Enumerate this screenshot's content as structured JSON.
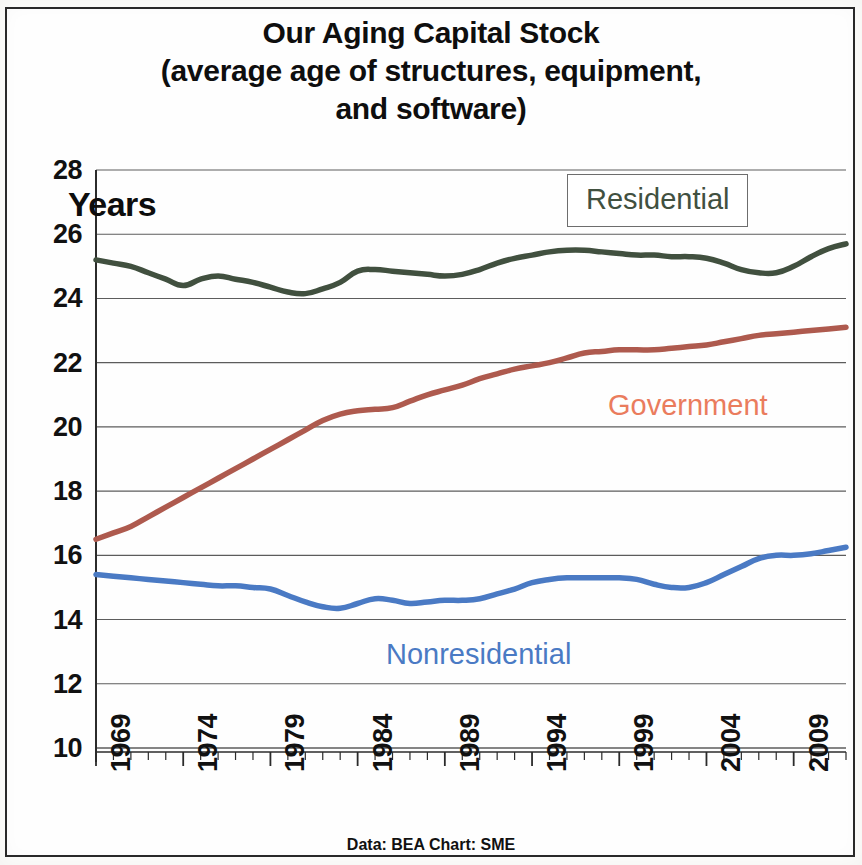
{
  "title": {
    "line1": "Our Aging Capital Stock",
    "line2": "(average age of structures, equipment,",
    "line3": "and software)"
  },
  "axis": {
    "y_label": "Years",
    "y_ticks": [
      "28",
      "26",
      "24",
      "22",
      "20",
      "18",
      "16",
      "14",
      "12",
      "10"
    ],
    "x_ticks": [
      "1969",
      "1974",
      "1979",
      "1984",
      "1989",
      "1994",
      "1999",
      "2004",
      "2009"
    ]
  },
  "labels": {
    "residential": "Residential",
    "government": "Government",
    "nonresidential": "Nonresidential"
  },
  "caption": "Data: BEA  Chart: SME",
  "colors": {
    "residential": "#41503f",
    "government": "#ae5a4e",
    "government_label": "#ea7c5d",
    "nonresidential": "#4a7ac4",
    "grid": "#5c5c5c",
    "axis": "#2b2b2b",
    "text": "#111111"
  },
  "chart_data": {
    "type": "line",
    "title": "Our Aging Capital Stock (average age of structures, equipment, and software)",
    "xlabel": "",
    "ylabel": "Years",
    "xlim": [
      1969,
      2012
    ],
    "ylim": [
      10,
      28
    ],
    "yticks": [
      10,
      12,
      14,
      16,
      18,
      20,
      22,
      24,
      26,
      28
    ],
    "xticks": [
      1969,
      1974,
      1979,
      1984,
      1989,
      1994,
      1999,
      2004,
      2009
    ],
    "grid": true,
    "legend_position": "inline-annotations",
    "annotations": [
      "Residential",
      "Government",
      "Nonresidential",
      "Data: BEA  Chart: SME"
    ],
    "x": [
      1969,
      1970,
      1971,
      1972,
      1973,
      1974,
      1975,
      1976,
      1977,
      1978,
      1979,
      1980,
      1981,
      1982,
      1983,
      1984,
      1985,
      1986,
      1987,
      1988,
      1989,
      1990,
      1991,
      1992,
      1993,
      1994,
      1995,
      1996,
      1997,
      1998,
      1999,
      2000,
      2001,
      2002,
      2003,
      2004,
      2005,
      2006,
      2007,
      2008,
      2009,
      2010,
      2011,
      2012
    ],
    "series": [
      {
        "name": "Residential",
        "color": "#41503f",
        "values": [
          25.2,
          25.1,
          25.0,
          24.8,
          24.6,
          24.4,
          24.6,
          24.7,
          24.6,
          24.5,
          24.35,
          24.2,
          24.15,
          24.3,
          24.5,
          24.85,
          24.9,
          24.85,
          24.8,
          24.75,
          24.7,
          24.75,
          24.9,
          25.1,
          25.25,
          25.35,
          25.45,
          25.5,
          25.5,
          25.45,
          25.4,
          25.35,
          25.35,
          25.3,
          25.3,
          25.25,
          25.1,
          24.9,
          24.8,
          24.8,
          25.0,
          25.3,
          25.55,
          25.7
        ]
      },
      {
        "name": "Government",
        "color": "#ae5a4e",
        "values": [
          16.5,
          16.7,
          16.9,
          17.2,
          17.5,
          17.8,
          18.1,
          18.4,
          18.7,
          19.0,
          19.3,
          19.6,
          19.9,
          20.2,
          20.4,
          20.5,
          20.55,
          20.6,
          20.8,
          21.0,
          21.15,
          21.3,
          21.5,
          21.65,
          21.8,
          21.9,
          22.0,
          22.15,
          22.3,
          22.35,
          22.4,
          22.4,
          22.4,
          22.45,
          22.5,
          22.55,
          22.65,
          22.75,
          22.85,
          22.9,
          22.95,
          23.0,
          23.05,
          23.1
        ]
      },
      {
        "name": "Nonresidential",
        "color": "#4a7ac4",
        "values": [
          15.4,
          15.35,
          15.3,
          15.25,
          15.2,
          15.15,
          15.1,
          15.05,
          15.05,
          15.0,
          14.95,
          14.75,
          14.55,
          14.4,
          14.35,
          14.5,
          14.65,
          14.6,
          14.5,
          14.55,
          14.6,
          14.6,
          14.65,
          14.8,
          14.95,
          15.15,
          15.25,
          15.3,
          15.3,
          15.3,
          15.3,
          15.25,
          15.1,
          15.0,
          15.0,
          15.15,
          15.4,
          15.65,
          15.9,
          16.0,
          16.0,
          16.05,
          16.15,
          16.25
        ]
      }
    ]
  }
}
